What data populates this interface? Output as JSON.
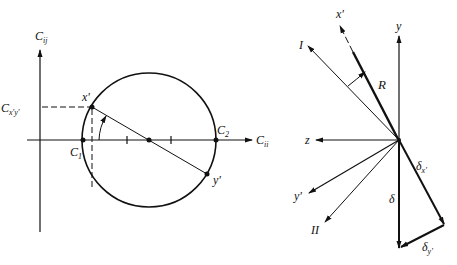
{
  "left_diagram": {
    "title": "Mohr circle",
    "labels": {
      "vertical_axis": "C",
      "vertical_axis_sub": "ij",
      "horizontal_axis": "C",
      "horizontal_axis_sub": "ii",
      "ordinate_value": "C",
      "ordinate_value_sub": "x'y'",
      "point_x_prime": "x'",
      "point_y_prime": "y'",
      "c1": "C",
      "c1_sub": "1",
      "c2": "C",
      "c2_sub": "2"
    }
  },
  "right_diagram": {
    "title": "Principal axes vector diagram",
    "labels": {
      "x_prime": "x'",
      "axis_I": "I",
      "y": "y",
      "R": "R",
      "z": "z",
      "y_prime": "y'",
      "axis_II": "II",
      "delta": "δ",
      "delta_x_prime": "δ",
      "delta_x_prime_sub": "x'",
      "delta_y_prime": "δ",
      "delta_y_prime_sub": "y'"
    }
  },
  "colors": {
    "stroke": "#111111",
    "background": "#ffffff"
  }
}
